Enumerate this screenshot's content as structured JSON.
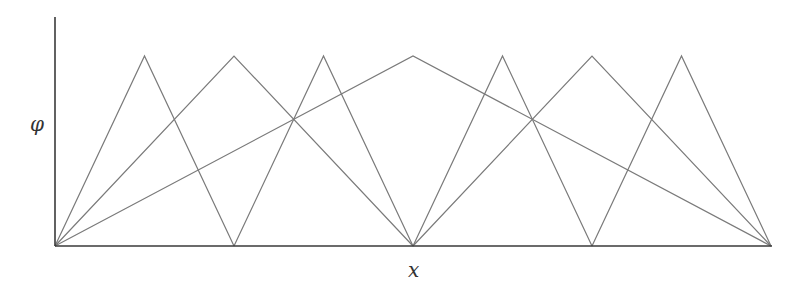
{
  "labels": {
    "y_axis": "φ",
    "x_axis": "x"
  },
  "colors": {
    "axis": "#3a3a3a",
    "lines": "#7a7a7a",
    "background": "#ffffff"
  },
  "chart_data": {
    "type": "line",
    "title": "",
    "xlabel": "x",
    "ylabel": "φ",
    "xlim": [
      0,
      1
    ],
    "ylim": [
      0,
      1
    ],
    "grid": false,
    "legend": null,
    "series": [
      {
        "name": "level 0, hat 1",
        "x": [
          0,
          0.5,
          1
        ],
        "y": [
          0,
          1,
          0
        ]
      },
      {
        "name": "level 1, hat 1",
        "x": [
          0,
          0.25,
          0.5
        ],
        "y": [
          0,
          1,
          0
        ]
      },
      {
        "name": "level 1, hat 2",
        "x": [
          0.5,
          0.75,
          1
        ],
        "y": [
          0,
          1,
          0
        ]
      },
      {
        "name": "level 2, hat 1",
        "x": [
          0,
          0.125,
          0.25
        ],
        "y": [
          0,
          1,
          0
        ]
      },
      {
        "name": "level 2, hat 2",
        "x": [
          0.25,
          0.375,
          0.5
        ],
        "y": [
          0,
          1,
          0
        ]
      },
      {
        "name": "level 2, hat 3",
        "x": [
          0.5,
          0.625,
          0.75
        ],
        "y": [
          0,
          1,
          0
        ]
      },
      {
        "name": "level 2, hat 4",
        "x": [
          0.75,
          0.875,
          1
        ],
        "y": [
          0,
          1,
          0
        ]
      }
    ]
  }
}
